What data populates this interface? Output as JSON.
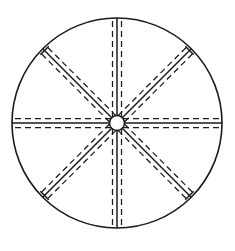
{
  "figure": {
    "background_color": "#ffffff",
    "line_color": "#1b1b1b"
  },
  "canvas": {
    "width": 235,
    "height": 251
  },
  "geometry": {
    "center_x": 117,
    "center_y": 123,
    "rim_radius": 105,
    "hub_radius": 7.5,
    "spoke_count": 8,
    "spoke_half_width": 4.5,
    "dash_pattern": "6 4"
  },
  "parts": {
    "rim_label": "rim",
    "hub_label": "hub",
    "spoke_label": "spoke",
    "solid_line_label": "spoke-centre-line",
    "dashed_line_label": "spoke-edge-hidden-line",
    "cap_label": "spoke-end-cap"
  },
  "spokes": [
    {
      "name": "spoke-north",
      "angle_deg": 270,
      "capped": false
    },
    {
      "name": "spoke-northeast",
      "angle_deg": 315,
      "capped": true
    },
    {
      "name": "spoke-east",
      "angle_deg": 0,
      "capped": false
    },
    {
      "name": "spoke-southeast",
      "angle_deg": 45,
      "capped": true
    },
    {
      "name": "spoke-south",
      "angle_deg": 90,
      "capped": false
    },
    {
      "name": "spoke-southwest",
      "angle_deg": 135,
      "capped": true
    },
    {
      "name": "spoke-west",
      "angle_deg": 180,
      "capped": false
    },
    {
      "name": "spoke-northwest",
      "angle_deg": 225,
      "capped": true
    }
  ]
}
